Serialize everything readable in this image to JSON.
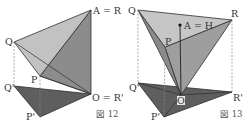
{
  "colors": {
    "light_face": "#c4c4c4",
    "mid_face": "#9a9a9a",
    "dark_face": "#707070",
    "shadow_face": "#5e5e5e",
    "edge": "#2f2f2f",
    "dashed": "#8a8a8a"
  },
  "figure12": {
    "caption": "図 12",
    "labels": {
      "A": "A = R",
      "Q": "Q",
      "P": "P",
      "Qp": "Q'",
      "O": "O = R'",
      "Pp": "P'"
    }
  },
  "figure13": {
    "caption": "図 13",
    "labels": {
      "Q": "Q",
      "R": "R",
      "A": "A = H",
      "P": "P",
      "Qp": "Q'",
      "Rp": "R'",
      "O": "O",
      "Pp": "P'"
    }
  }
}
